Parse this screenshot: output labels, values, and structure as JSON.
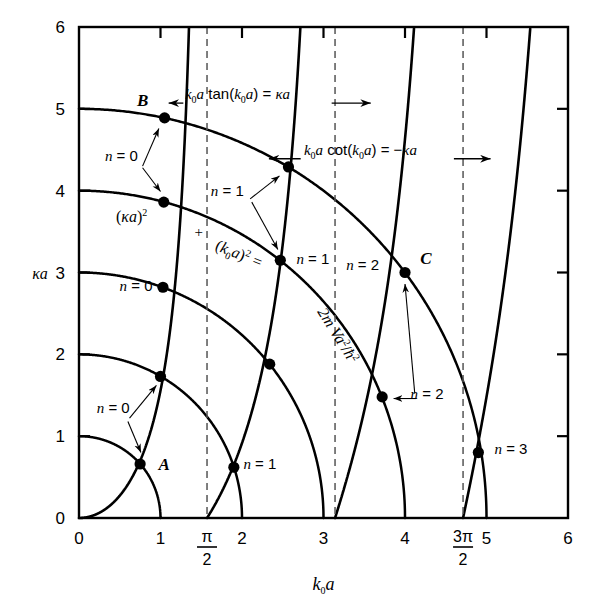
{
  "figure": {
    "kind": "transcendental-equation-graph",
    "background_color": "#ffffff",
    "line_color": "#000000",
    "dashed_color": "#555555"
  },
  "axes": {
    "x_label": "k₀a",
    "y_label": "κa",
    "x_range": [
      0,
      6
    ],
    "y_range": [
      0,
      6
    ],
    "x_ticks": [
      {
        "value": 0,
        "label": "0"
      },
      {
        "value": 1,
        "label": "1"
      },
      {
        "value": 1.5708,
        "label": "π/2",
        "fraction": true,
        "num": "π",
        "den": "2"
      },
      {
        "value": 2,
        "label": "2"
      },
      {
        "value": 3,
        "label": "3"
      },
      {
        "value": 4,
        "label": "4"
      },
      {
        "value": 4.7124,
        "label": "3π/2",
        "fraction": true,
        "num": "3π",
        "den": "2"
      },
      {
        "value": 5,
        "label": "5"
      },
      {
        "value": 6,
        "label": "6"
      }
    ],
    "y_ticks": [
      {
        "value": 0,
        "label": "0"
      },
      {
        "value": 1,
        "label": "1"
      },
      {
        "value": 2,
        "label": "2"
      },
      {
        "value": 3,
        "label": "3"
      },
      {
        "value": 4,
        "label": "4"
      },
      {
        "value": 5,
        "label": "5"
      },
      {
        "value": 6,
        "label": "6"
      }
    ],
    "grid": false
  },
  "chart_data": {
    "type": "line",
    "title": "",
    "xlabel": "k₀a",
    "ylabel": "κa",
    "xlim": [
      0,
      6
    ],
    "ylim": [
      0,
      6
    ],
    "grid": false,
    "series": [
      {
        "name": "k0a tan(k0a) = κa",
        "equation": "k₀a tan(k₀a) = κa",
        "style": "solid",
        "branches": [
          [
            0,
            1.5708
          ],
          [
            3.1416,
            4.7124
          ]
        ]
      },
      {
        "name": "k0a cot(k0a) = -κa",
        "equation": "k₀a cot(k₀a) = −κa",
        "style": "solid",
        "branches": [
          [
            1.5708,
            3.1416
          ],
          [
            4.7124,
            6.2832
          ]
        ]
      },
      {
        "name": "circles (κa)² + (k₀a)² = 2mVa²/ħ²",
        "equation": "(κa)² + (k₀a)² = 2mVa²/ħ²",
        "style": "solid",
        "radii": [
          1,
          2,
          3,
          4,
          5
        ]
      }
    ],
    "asymptotes": {
      "style": "dashed",
      "x_values": [
        1.5708,
        3.1416,
        4.7124
      ]
    },
    "intersection_points": [
      {
        "x": 0.75,
        "y": 0.66,
        "label": "A",
        "n": "n = 0",
        "radius": 1
      },
      {
        "x": 1.0,
        "y": 1.73,
        "label": "",
        "n": "n = 0",
        "radius": 2
      },
      {
        "x": 1.03,
        "y": 2.82,
        "label": "",
        "n": "n = 0",
        "radius": 3
      },
      {
        "x": 1.04,
        "y": 3.86,
        "label": "",
        "n": "n = 0",
        "radius": 4
      },
      {
        "x": 1.05,
        "y": 4.89,
        "label": "B",
        "n": "n = 0",
        "radius": 5
      },
      {
        "x": 1.9,
        "y": 0.62,
        "label": "",
        "n": "n = 1",
        "radius": 2
      },
      {
        "x": 2.34,
        "y": 1.88,
        "label": "",
        "n": "n = 1",
        "radius": 3
      },
      {
        "x": 2.47,
        "y": 3.15,
        "label": "",
        "n": "n = 1",
        "radius": 4
      },
      {
        "x": 2.57,
        "y": 4.29,
        "label": "",
        "n": "n = 1",
        "radius": 5
      },
      {
        "x": 3.72,
        "y": 1.48,
        "label": "",
        "n": "n = 2",
        "radius": 4
      },
      {
        "x": 4.0,
        "y": 3.0,
        "label": "C",
        "n": "n = 2",
        "radius": 5
      },
      {
        "x": 4.9,
        "y": 0.8,
        "label": "",
        "n": "n = 3",
        "radius": 5
      }
    ]
  },
  "annotations": {
    "tan_eq": "k₀a tan(k₀a) = κa",
    "cot_eq": "k₀a cot(k₀a) = −κa",
    "circle_eq_part1": "(κa)²",
    "circle_eq_plus": "+",
    "circle_eq_part2": "(k₀a)² =",
    "circle_eq_part3": "2m Va²/ħ²",
    "point_A": "A",
    "point_B": "B",
    "point_C": "C",
    "n0_upper": "n = 0",
    "n0_mid": "n = 0",
    "n0_lower": "n = 0",
    "n1_upper": "n = 1",
    "n1_mid": "n = 1",
    "n1_lower": "n = 1",
    "n2_upper": "n = 2",
    "n2_lower": "n = 2",
    "n3": "n = 3"
  }
}
